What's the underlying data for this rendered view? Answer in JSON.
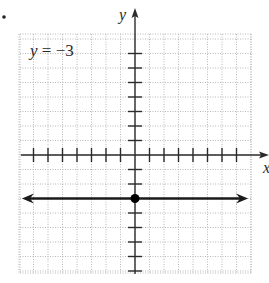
{
  "chart_data": {
    "type": "line",
    "title": "",
    "equation_label": "y = −3",
    "equation_parts": {
      "var": "y",
      "rest": " = −3"
    },
    "xlabel": "x",
    "ylabel": "y",
    "xlim": [
      -8,
      8
    ],
    "ylim": [
      -8,
      8
    ],
    "grid": true,
    "grid_style": "dotted",
    "tick_marks_x": [
      -7,
      -6,
      -5,
      -4,
      -3,
      -2,
      -1,
      1,
      2,
      3,
      4,
      5,
      6,
      7
    ],
    "tick_marks_y": [
      -8,
      -7,
      -6,
      -5,
      -4,
      -2,
      -1,
      1,
      2,
      3,
      4,
      5,
      6,
      7
    ],
    "series": [
      {
        "name": "y = -3",
        "kind": "horizontal-line",
        "y": -3,
        "x_range": [
          -7.8,
          7.8
        ],
        "arrows": "both",
        "color": "#1a1a1a"
      }
    ],
    "points": [
      {
        "x": 0,
        "y": -3,
        "label": "y-intercept",
        "color": "#000000"
      }
    ],
    "legend": null
  },
  "bullet": "•",
  "colors": {
    "axis": "#2b2b2b",
    "grid": "#b8b8b8",
    "line": "#1a1a1a",
    "text": "#2a2a2a"
  }
}
